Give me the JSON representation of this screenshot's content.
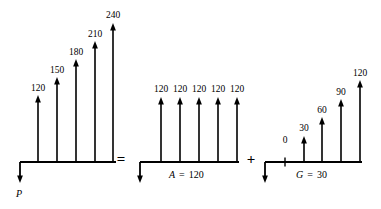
{
  "figure": {
    "type": "cash-flow-diagram",
    "stroke_color": "#000000",
    "background_color": "#ffffff",
    "baseline_y": 162,
    "operators": [
      {
        "symbol": "=",
        "x": 120,
        "y": 160
      },
      {
        "symbol": "+",
        "x": 250,
        "y": 160
      }
    ],
    "diagrams": [
      {
        "name": "gradient-total",
        "origin_x": 20,
        "baseline_end_x": 116,
        "down_arrow": {
          "label": "P",
          "label_x": 17,
          "label_y": 188,
          "tip_y": 183
        },
        "arrows": [
          {
            "value": "120",
            "x": 38,
            "tip_y": 95
          },
          {
            "value": "150",
            "x": 57,
            "tip_y": 77
          },
          {
            "value": "180",
            "x": 76,
            "tip_y": 59
          },
          {
            "value": "210",
            "x": 95,
            "tip_y": 41
          },
          {
            "value": "240",
            "x": 113,
            "tip_y": 23
          }
        ]
      },
      {
        "name": "uniform-series",
        "origin_x": 140,
        "baseline_end_x": 239,
        "down_arrow": {
          "label": "",
          "tip_y": 183
        },
        "series_label": {
          "symbol": "A",
          "equals": "=",
          "value": "120",
          "x": 172,
          "y": 170
        },
        "arrows": [
          {
            "value": "120",
            "x": 161,
            "tip_y": 97
          },
          {
            "value": "120",
            "x": 180,
            "tip_y": 97
          },
          {
            "value": "120",
            "x": 199,
            "tip_y": 97
          },
          {
            "value": "120",
            "x": 218,
            "tip_y": 97
          },
          {
            "value": "120",
            "x": 237,
            "tip_y": 97
          }
        ]
      },
      {
        "name": "gradient-series",
        "origin_x": 265,
        "baseline_end_x": 362,
        "down_arrow": {
          "label": "",
          "tip_y": 183
        },
        "series_label": {
          "symbol": "G",
          "equals": "=",
          "value": "30",
          "x": 298,
          "y": 170
        },
        "zero_tick": {
          "value": "0",
          "x": 285
        },
        "arrows": [
          {
            "value": "30",
            "x": 304,
            "tip_y": 136
          },
          {
            "value": "60",
            "x": 322,
            "tip_y": 117
          },
          {
            "value": "90",
            "x": 341,
            "tip_y": 99
          },
          {
            "value": "120",
            "x": 360,
            "tip_y": 80
          }
        ]
      }
    ]
  },
  "chart_data": {
    "type": "bar",
    "xlabel": "",
    "ylabel": "",
    "categories": [
      "1",
      "2",
      "3",
      "4",
      "5"
    ],
    "series": [
      {
        "name": "Total cash flow (P)",
        "values": [
          120,
          150,
          180,
          210,
          240
        ]
      },
      {
        "name": "A = 120",
        "values": [
          120,
          120,
          120,
          120,
          120
        ]
      },
      {
        "name": "G = 30",
        "values": [
          0,
          30,
          60,
          90,
          120
        ]
      }
    ],
    "annotations": [
      "P",
      "A = 120",
      "G = 30",
      "=",
      "+"
    ]
  }
}
